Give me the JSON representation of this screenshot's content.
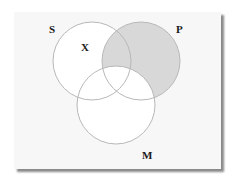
{
  "diagram": {
    "type": "venn",
    "sets": [
      {
        "id": "S",
        "label": "S",
        "cx": 92,
        "cy": 61,
        "r": 39
      },
      {
        "id": "P",
        "label": "P",
        "cx": 141,
        "cy": 61,
        "r": 39
      },
      {
        "id": "M",
        "label": "M",
        "cx": 116,
        "cy": 105,
        "r": 39
      }
    ],
    "shaded_region": "P minus M",
    "marks": [
      {
        "label": "X",
        "region": "S only"
      }
    ],
    "labels": {
      "S": "S",
      "P": "P",
      "M": "M",
      "X": "X"
    },
    "colors": {
      "card": "#f7f7f7",
      "circle_stroke": "#b8b8b8",
      "shade": "#d8d8d8",
      "circle_fill": "#ffffff",
      "shadow": "#8a8a8a",
      "text": "#1a1a1a"
    }
  }
}
